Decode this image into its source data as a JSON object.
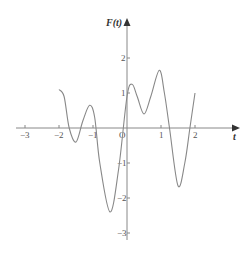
{
  "chart_data": {
    "type": "line",
    "title": "",
    "xlabel": "t",
    "ylabel": "F(t)",
    "origin_label": "O",
    "xlim": [
      -3.2,
      3.2
    ],
    "ylim": [
      -3.2,
      2.5
    ],
    "x_ticks": [
      -3,
      -2,
      -1,
      1,
      2
    ],
    "x_tick_labels": [
      "−3",
      "−2",
      "−1",
      "1",
      "2"
    ],
    "y_ticks": [
      2,
      1,
      -1,
      -2,
      -3
    ],
    "y_tick_labels": [
      "2",
      "1",
      "−1",
      "−2",
      "−3"
    ],
    "grid": false,
    "legend": null,
    "series": [
      {
        "name": "F(t)",
        "color": "#888888",
        "x": [
          -2,
          -1.85,
          -1.7,
          -1.5,
          -1.3,
          -1.1,
          -0.95,
          -0.8,
          -0.5,
          -0.25,
          0,
          0.15,
          0.3,
          0.5,
          0.7,
          0.95,
          1.1,
          1.25,
          1.5,
          1.7,
          1.85,
          2
        ],
        "y": [
          1.1,
          0.9,
          0,
          -0.4,
          0.2,
          0.65,
          0.3,
          -1.0,
          -2.4,
          -1.2,
          0.9,
          1.25,
          0.9,
          0.4,
          0.9,
          1.65,
          1.0,
          0,
          -1.65,
          -1.0,
          0,
          1.0
        ]
      }
    ]
  }
}
